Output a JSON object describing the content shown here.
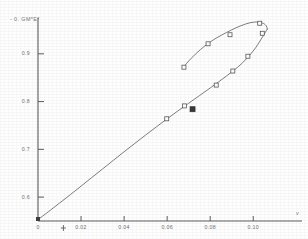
{
  "chart_data": {
    "type": "line",
    "title": "",
    "xlabel": "v",
    "ylabel": "- 0. GM*E*",
    "xlim": [
      0,
      0.118
    ],
    "ylim": [
      0.55,
      0.975
    ],
    "grid": false,
    "legend": null,
    "xticks": [
      {
        "value": 0,
        "label": "0"
      },
      {
        "value": 0.02,
        "label": "0.02"
      },
      {
        "value": 0.04,
        "label": "0.04"
      },
      {
        "value": 0.06,
        "label": "0.06"
      },
      {
        "value": 0.08,
        "label": "0.08"
      },
      {
        "value": 0.1,
        "label": "0.10"
      }
    ],
    "yticks": [
      {
        "value": 0.6,
        "label": "0.6"
      },
      {
        "value": 0.7,
        "label": "0.7"
      },
      {
        "value": 0.8,
        "label": "0.8"
      },
      {
        "value": 0.9,
        "label": "0.9"
      }
    ],
    "series": [
      {
        "name": "lower-ascending-branch",
        "style": "solid-curve",
        "x": [
          0.0,
          0.005,
          0.01,
          0.015,
          0.02,
          0.025,
          0.03,
          0.035,
          0.04,
          0.045,
          0.05,
          0.055,
          0.06,
          0.065,
          0.07,
          0.075,
          0.08,
          0.085,
          0.09,
          0.095,
          0.1,
          0.104,
          0.1065
        ],
        "y": [
          0.553,
          0.57,
          0.5875,
          0.605,
          0.623,
          0.641,
          0.659,
          0.677,
          0.695,
          0.7125,
          0.73,
          0.747,
          0.764,
          0.7805,
          0.7965,
          0.8125,
          0.8285,
          0.845,
          0.862,
          0.881,
          0.906,
          0.933,
          0.952
        ]
      },
      {
        "name": "upper-returning-branch",
        "style": "solid-curve",
        "x": [
          0.1065,
          0.106,
          0.104,
          0.1005,
          0.0965,
          0.092,
          0.0875,
          0.083,
          0.079,
          0.0755,
          0.0725,
          0.07,
          0.0683,
          0.0675
        ],
        "y": [
          0.952,
          0.959,
          0.965,
          0.9665,
          0.9625,
          0.9545,
          0.9445,
          0.9335,
          0.9215,
          0.909,
          0.8965,
          0.885,
          0.876,
          0.8715
        ]
      }
    ],
    "markers_open": [
      {
        "x": 0.0598,
        "y": 0.764
      },
      {
        "x": 0.068,
        "y": 0.791
      },
      {
        "x": 0.0828,
        "y": 0.8345
      },
      {
        "x": 0.0905,
        "y": 0.864
      },
      {
        "x": 0.0975,
        "y": 0.895
      },
      {
        "x": 0.1042,
        "y": 0.943
      },
      {
        "x": 0.103,
        "y": 0.964
      },
      {
        "x": 0.0892,
        "y": 0.94
      },
      {
        "x": 0.079,
        "y": 0.921
      },
      {
        "x": 0.0678,
        "y": 0.872
      }
    ],
    "markers_filled": [
      {
        "x": 0.0718,
        "y": 0.784
      }
    ],
    "annotations": [
      {
        "name": "axis-cross-mark",
        "x": 0.0118,
        "y_px": 228,
        "glyph": "+"
      }
    ]
  }
}
